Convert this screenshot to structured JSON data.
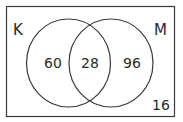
{
  "diagram": {
    "type": "venn",
    "sets": [
      {
        "name": "K",
        "only": "60"
      },
      {
        "name": "M",
        "only": "96"
      }
    ],
    "intersection": "28",
    "outside": "16",
    "labels": {
      "left": "K",
      "right": "M"
    },
    "colors": {
      "stroke": "#3a3a3a",
      "text": "#2a2a2a",
      "background": "#ffffff"
    }
  }
}
